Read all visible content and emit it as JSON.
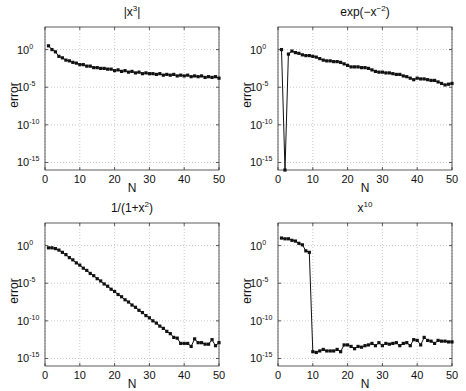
{
  "figure": {
    "ylabel": "error",
    "xlabel": "N",
    "xticks": [
      "0",
      "10",
      "20",
      "30",
      "40",
      "50"
    ],
    "yticks": [
      {
        "base": "10",
        "exp": "0"
      },
      {
        "base": "10",
        "exp": "-5"
      },
      {
        "base": "10",
        "exp": "-10"
      },
      {
        "base": "10",
        "exp": "-15"
      }
    ]
  },
  "chart_data": [
    {
      "type": "line",
      "title": "|x^3|",
      "title_base": "|x",
      "title_sup": "3",
      "title_tail": "|",
      "xlabel": "N",
      "ylabel": "error",
      "yscale": "log",
      "xlim": [
        0,
        50
      ],
      "ylim": [
        1e-16,
        1000.0
      ],
      "grid": true,
      "x": [
        1,
        2,
        3,
        4,
        5,
        6,
        7,
        8,
        9,
        10,
        11,
        12,
        13,
        14,
        15,
        16,
        17,
        18,
        19,
        20,
        21,
        22,
        23,
        24,
        25,
        26,
        27,
        28,
        29,
        30,
        31,
        32,
        33,
        34,
        35,
        36,
        37,
        38,
        39,
        40,
        41,
        42,
        43,
        44,
        45,
        46,
        47,
        48,
        49,
        50
      ],
      "log10_y": [
        0.5,
        0.0,
        -0.3,
        -0.9,
        -1.1,
        -1.4,
        -1.5,
        -1.7,
        -1.8,
        -2.0,
        -2.0,
        -2.2,
        -2.2,
        -2.4,
        -2.4,
        -2.5,
        -2.5,
        -2.6,
        -2.6,
        -2.8,
        -2.7,
        -2.9,
        -2.8,
        -3.0,
        -2.9,
        -3.1,
        -3.0,
        -3.2,
        -3.1,
        -3.2,
        -3.2,
        -3.3,
        -3.2,
        -3.4,
        -3.3,
        -3.4,
        -3.3,
        -3.5,
        -3.4,
        -3.5,
        -3.4,
        -3.6,
        -3.5,
        -3.6,
        -3.5,
        -3.7,
        -3.6,
        -3.7,
        -3.6,
        -3.8
      ]
    },
    {
      "type": "line",
      "title": "exp(-x^-2)",
      "title_base": "exp(−x",
      "title_sup": "−2",
      "title_tail": ")",
      "xlabel": "N",
      "ylabel": "error",
      "yscale": "log",
      "xlim": [
        0,
        50
      ],
      "ylim": [
        1e-16,
        1000.0
      ],
      "grid": true,
      "x": [
        1,
        2,
        3,
        4,
        5,
        6,
        7,
        8,
        9,
        10,
        11,
        12,
        13,
        14,
        15,
        16,
        17,
        18,
        19,
        20,
        21,
        22,
        23,
        24,
        25,
        26,
        27,
        28,
        29,
        30,
        31,
        32,
        33,
        34,
        35,
        36,
        37,
        38,
        39,
        40,
        41,
        42,
        43,
        44,
        45,
        46,
        47,
        48,
        49,
        50
      ],
      "log10_y": [
        0.0,
        -16.0,
        -0.6,
        -0.2,
        -0.4,
        -0.5,
        -0.7,
        -0.8,
        -0.8,
        -0.9,
        -1.0,
        -1.2,
        -1.4,
        -1.5,
        -1.5,
        -1.6,
        -1.6,
        -1.7,
        -1.9,
        -2.1,
        -2.3,
        -2.3,
        -2.3,
        -2.4,
        -2.4,
        -2.5,
        -2.7,
        -2.9,
        -3.0,
        -3.0,
        -3.1,
        -3.1,
        -3.2,
        -3.3,
        -3.3,
        -3.5,
        -3.6,
        -3.8,
        -4.0,
        -3.8,
        -3.9,
        -3.9,
        -4.0,
        -4.1,
        -4.1,
        -4.3,
        -4.5,
        -4.7,
        -4.6,
        -4.5
      ]
    },
    {
      "type": "line",
      "title": "1/(1+x^2)",
      "title_base": "1/(1+x",
      "title_sup": "2",
      "title_tail": ")",
      "xlabel": "N",
      "ylabel": "error",
      "yscale": "log",
      "xlim": [
        0,
        50
      ],
      "ylim": [
        1e-16,
        1000.0
      ],
      "grid": true,
      "x": [
        1,
        2,
        3,
        4,
        5,
        6,
        7,
        8,
        9,
        10,
        11,
        12,
        13,
        14,
        15,
        16,
        17,
        18,
        19,
        20,
        21,
        22,
        23,
        24,
        25,
        26,
        27,
        28,
        29,
        30,
        31,
        32,
        33,
        34,
        35,
        36,
        37,
        38,
        39,
        40,
        41,
        42,
        43,
        44,
        45,
        46,
        47,
        48,
        49,
        50
      ],
      "log10_y": [
        -0.3,
        -0.3,
        -0.4,
        -0.6,
        -0.9,
        -1.2,
        -1.6,
        -1.9,
        -2.3,
        -2.6,
        -3.0,
        -3.3,
        -3.7,
        -4.0,
        -4.4,
        -4.7,
        -5.1,
        -5.4,
        -5.8,
        -6.1,
        -6.5,
        -6.8,
        -7.2,
        -7.5,
        -7.9,
        -8.2,
        -8.6,
        -8.9,
        -9.3,
        -9.6,
        -10.0,
        -10.3,
        -10.7,
        -11.0,
        -11.4,
        -11.7,
        -12.2,
        -12.3,
        -13.0,
        -13.0,
        -13.0,
        -13.4,
        -12.4,
        -12.9,
        -12.9,
        -13.1,
        -13.1,
        -12.5,
        -13.3,
        -12.9
      ]
    },
    {
      "type": "line",
      "title": "x^10",
      "title_base": "x",
      "title_sup": "10",
      "title_tail": "",
      "xlabel": "N",
      "ylabel": "error",
      "yscale": "log",
      "xlim": [
        0,
        50
      ],
      "ylim": [
        1e-16,
        1000.0
      ],
      "grid": true,
      "x": [
        1,
        2,
        3,
        4,
        5,
        6,
        7,
        8,
        9,
        10,
        11,
        12,
        13,
        14,
        15,
        16,
        17,
        18,
        19,
        20,
        21,
        22,
        23,
        24,
        25,
        26,
        27,
        28,
        29,
        30,
        31,
        32,
        33,
        34,
        35,
        36,
        37,
        38,
        39,
        40,
        41,
        42,
        43,
        44,
        45,
        46,
        47,
        48,
        49,
        50
      ],
      "log10_y": [
        1.0,
        0.9,
        0.9,
        0.7,
        0.6,
        0.3,
        0.1,
        -0.7,
        -0.9,
        -14.1,
        -14.2,
        -14.0,
        -13.8,
        -14.0,
        -14.0,
        -14.0,
        -13.8,
        -14.1,
        -13.2,
        -13.2,
        -13.4,
        -13.7,
        -13.4,
        -13.5,
        -13.3,
        -13.2,
        -13.0,
        -13.3,
        -12.9,
        -13.3,
        -13.0,
        -13.1,
        -13.0,
        -12.9,
        -13.3,
        -13.0,
        -12.9,
        -13.3,
        -12.5,
        -12.6,
        -13.2,
        -12.2,
        -12.6,
        -12.7,
        -13.0,
        -12.6,
        -12.7,
        -12.7,
        -12.8,
        -12.8
      ]
    }
  ]
}
